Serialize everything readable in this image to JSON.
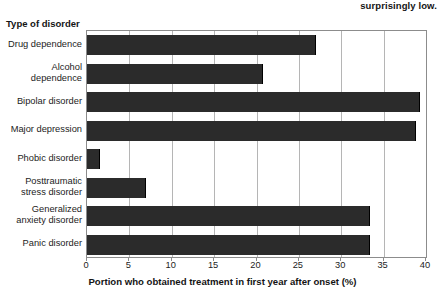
{
  "caption": {
    "fragment": "surprisingly low."
  },
  "chart_data": {
    "type": "bar",
    "orientation": "horizontal",
    "title": "",
    "xlabel": "Portion who obtained treatment in first year after onset (%)",
    "ylabel": "Type of disorder",
    "xlim": [
      0,
      40
    ],
    "xticks": [
      0,
      5,
      10,
      15,
      20,
      25,
      30,
      35,
      40
    ],
    "xtick_labels": [
      "0",
      "5",
      "10",
      "15",
      "20",
      "25",
      "30",
      "35",
      "40"
    ],
    "grid": "vertical",
    "legend": "none",
    "bar_color": "#2b2b2b",
    "categories": [
      "Drug dependence",
      "Alcohol dependence",
      "Bipolar disorder",
      "Major depression",
      "Phobic disorder",
      "Posttraumatic stress disorder",
      "Generalized anxiety disorder",
      "Panic disorder"
    ],
    "category_lines": [
      [
        "Drug dependence"
      ],
      [
        "Alcohol",
        "dependence"
      ],
      [
        "Bipolar disorder"
      ],
      [
        "Major depression"
      ],
      [
        "Phobic disorder"
      ],
      [
        "Posttraumatic",
        "stress disorder"
      ],
      [
        "Generalized",
        "anxiety disorder"
      ],
      [
        "Panic disorder"
      ]
    ],
    "values": [
      27.0,
      20.8,
      39.3,
      38.8,
      1.5,
      7.0,
      33.4,
      33.4
    ]
  }
}
